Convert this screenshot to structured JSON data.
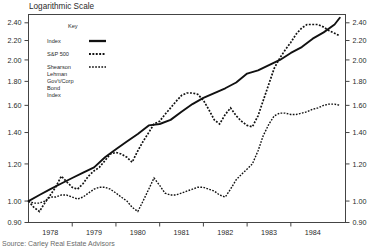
{
  "title": "Logarithmic Scale",
  "source_note": "Source: Carley Real Estate Advisors",
  "legend": {
    "heading": "Key",
    "entries": [
      {
        "label": "Index",
        "style": "solid"
      },
      {
        "label": "S&P 500",
        "style": "dotted"
      },
      {
        "label": "Shearson",
        "style": "dashed"
      },
      {
        "label": "Lehman",
        "style": "none"
      },
      {
        "label": "Gov't/Corp",
        "style": "none"
      },
      {
        "label": "Bond",
        "style": "none"
      },
      {
        "label": "Index",
        "style": "none"
      }
    ]
  },
  "chart_data": {
    "type": "line",
    "title": "Logarithmic Scale",
    "xlabel": "",
    "ylabel": "",
    "yscale": "log",
    "ylim": [
      0.9,
      2.5
    ],
    "ytick_labels": [
      "2.40",
      "2.20",
      "2.00",
      "1.80",
      "1.60",
      "1.40",
      "1.20",
      "1.00",
      "0.90"
    ],
    "ytick_values": [
      2.4,
      2.2,
      2.0,
      1.8,
      1.6,
      1.4,
      1.2,
      1.0,
      0.9
    ],
    "right_axis_labels": [
      "2.40",
      "2.20",
      "2.00",
      "1.80",
      "1.60",
      "1.40",
      "1.20",
      "1.00",
      "0.90"
    ],
    "categories": [
      "1978",
      "1979",
      "1980",
      "1981",
      "1982",
      "1983",
      "1984"
    ],
    "xlim": [
      1977.5,
      1984.75
    ],
    "grid": false,
    "legend_position": "upper-left-inside",
    "series": [
      {
        "name": "Index",
        "style": "solid",
        "x": [
          1977.5,
          1977.75,
          1978.0,
          1978.25,
          1978.5,
          1978.75,
          1979.0,
          1979.25,
          1979.5,
          1979.75,
          1980.0,
          1980.25,
          1980.5,
          1980.75,
          1981.0,
          1981.25,
          1981.5,
          1981.75,
          1982.0,
          1982.25,
          1982.5,
          1982.75,
          1983.0,
          1983.25,
          1983.5,
          1983.75,
          1984.0,
          1984.25,
          1984.5,
          1984.62
        ],
        "values": [
          1.0,
          1.03,
          1.06,
          1.09,
          1.12,
          1.15,
          1.18,
          1.24,
          1.29,
          1.34,
          1.39,
          1.45,
          1.46,
          1.49,
          1.55,
          1.61,
          1.66,
          1.7,
          1.74,
          1.79,
          1.87,
          1.9,
          1.95,
          2.0,
          2.07,
          2.13,
          2.22,
          2.29,
          2.38,
          2.46
        ]
      },
      {
        "name": "S&P 500",
        "style": "dotted",
        "x": [
          1977.5,
          1977.62,
          1977.75,
          1977.87,
          1978.0,
          1978.12,
          1978.25,
          1978.37,
          1978.5,
          1978.62,
          1978.75,
          1978.87,
          1979.0,
          1979.12,
          1979.25,
          1979.37,
          1979.5,
          1979.62,
          1979.75,
          1979.87,
          1980.0,
          1980.12,
          1980.25,
          1980.37,
          1980.5,
          1980.62,
          1980.75,
          1980.87,
          1981.0,
          1981.12,
          1981.25,
          1981.37,
          1981.5,
          1981.62,
          1981.75,
          1981.87,
          1982.0,
          1982.12,
          1982.25,
          1982.37,
          1982.5,
          1982.62,
          1982.75,
          1982.87,
          1983.0,
          1983.12,
          1983.25,
          1983.37,
          1983.5,
          1983.62,
          1983.75,
          1983.87,
          1984.0,
          1984.12,
          1984.25,
          1984.37,
          1984.5,
          1984.62
        ],
        "values": [
          1.0,
          0.97,
          0.95,
          0.99,
          1.03,
          1.07,
          1.13,
          1.1,
          1.07,
          1.06,
          1.09,
          1.13,
          1.16,
          1.18,
          1.22,
          1.26,
          1.27,
          1.26,
          1.24,
          1.21,
          1.28,
          1.34,
          1.4,
          1.46,
          1.48,
          1.53,
          1.58,
          1.63,
          1.68,
          1.7,
          1.7,
          1.69,
          1.64,
          1.57,
          1.49,
          1.46,
          1.53,
          1.58,
          1.52,
          1.48,
          1.45,
          1.44,
          1.52,
          1.64,
          1.78,
          1.92,
          2.02,
          2.1,
          2.18,
          2.27,
          2.34,
          2.38,
          2.38,
          2.38,
          2.35,
          2.31,
          2.28,
          2.25
        ]
      },
      {
        "name": "Shearson Lehman Gov't/Corp Bond Index",
        "style": "dashed",
        "x": [
          1977.5,
          1977.62,
          1977.75,
          1977.87,
          1978.0,
          1978.12,
          1978.25,
          1978.37,
          1978.5,
          1978.62,
          1978.75,
          1978.87,
          1979.0,
          1979.12,
          1979.25,
          1979.37,
          1979.5,
          1979.62,
          1979.75,
          1979.87,
          1980.0,
          1980.12,
          1980.25,
          1980.37,
          1980.5,
          1980.62,
          1980.75,
          1980.87,
          1981.0,
          1981.12,
          1981.25,
          1981.37,
          1981.5,
          1981.62,
          1981.75,
          1981.87,
          1982.0,
          1982.12,
          1982.25,
          1982.37,
          1982.5,
          1982.62,
          1982.75,
          1982.87,
          1983.0,
          1983.12,
          1983.25,
          1983.37,
          1983.5,
          1983.62,
          1983.75,
          1983.87,
          1984.0,
          1984.12,
          1984.25,
          1984.37,
          1984.5,
          1984.62
        ],
        "values": [
          1.0,
          0.99,
          0.99,
          1.0,
          1.02,
          1.02,
          1.03,
          1.03,
          1.02,
          1.01,
          1.02,
          1.04,
          1.06,
          1.07,
          1.07,
          1.06,
          1.04,
          1.02,
          1.0,
          0.97,
          0.95,
          1.0,
          1.06,
          1.12,
          1.08,
          1.04,
          1.03,
          1.03,
          1.04,
          1.05,
          1.06,
          1.07,
          1.07,
          1.06,
          1.05,
          1.03,
          1.02,
          1.06,
          1.11,
          1.14,
          1.17,
          1.2,
          1.28,
          1.38,
          1.46,
          1.52,
          1.54,
          1.54,
          1.53,
          1.53,
          1.54,
          1.55,
          1.57,
          1.58,
          1.6,
          1.61,
          1.61,
          1.6
        ]
      }
    ]
  }
}
